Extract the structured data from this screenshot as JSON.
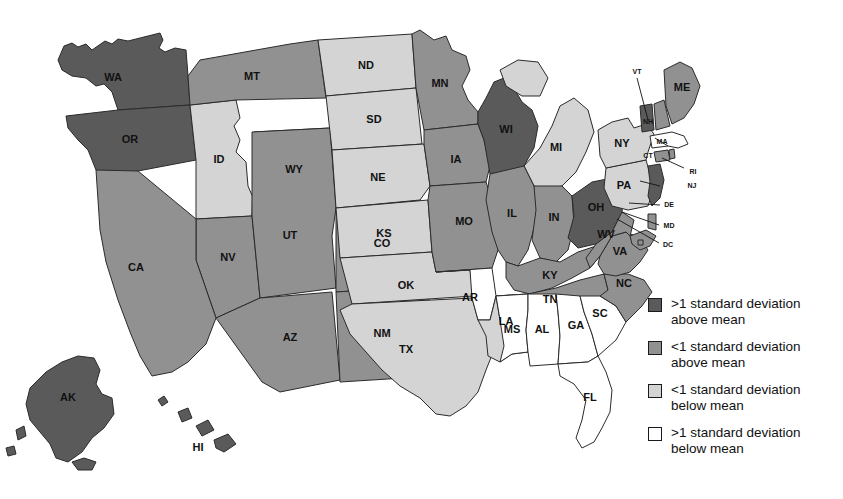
{
  "map": {
    "title": "US choropleth map of standard deviation from mean",
    "palette": {
      "dark": "#5a5a5a",
      "medium": "#919191",
      "light": "#d4d4d4",
      "white": "#ffffff",
      "border": "#2b2b2b"
    },
    "states": [
      {
        "code": "WA",
        "class": "dark"
      },
      {
        "code": "OR",
        "class": "dark"
      },
      {
        "code": "ID",
        "class": "light"
      },
      {
        "code": "MT",
        "class": "medium"
      },
      {
        "code": "WY",
        "class": "medium"
      },
      {
        "code": "NV",
        "class": "medium"
      },
      {
        "code": "CA",
        "class": "medium"
      },
      {
        "code": "UT",
        "class": "medium"
      },
      {
        "code": "CO",
        "class": "medium"
      },
      {
        "code": "AZ",
        "class": "medium"
      },
      {
        "code": "NM",
        "class": "medium"
      },
      {
        "code": "ND",
        "class": "light"
      },
      {
        "code": "SD",
        "class": "light"
      },
      {
        "code": "NE",
        "class": "light"
      },
      {
        "code": "KS",
        "class": "light"
      },
      {
        "code": "OK",
        "class": "light"
      },
      {
        "code": "TX",
        "class": "light"
      },
      {
        "code": "MN",
        "class": "medium"
      },
      {
        "code": "IA",
        "class": "medium"
      },
      {
        "code": "MO",
        "class": "medium"
      },
      {
        "code": "AR",
        "class": "white"
      },
      {
        "code": "LA",
        "class": "light"
      },
      {
        "code": "WI",
        "class": "dark"
      },
      {
        "code": "MI",
        "class": "light"
      },
      {
        "code": "IL",
        "class": "medium"
      },
      {
        "code": "IN",
        "class": "medium"
      },
      {
        "code": "OH",
        "class": "dark"
      },
      {
        "code": "KY",
        "class": "medium"
      },
      {
        "code": "TN",
        "class": "medium"
      },
      {
        "code": "MS",
        "class": "white"
      },
      {
        "code": "AL",
        "class": "white"
      },
      {
        "code": "GA",
        "class": "white"
      },
      {
        "code": "FL",
        "class": "white"
      },
      {
        "code": "SC",
        "class": "white"
      },
      {
        "code": "NC",
        "class": "medium"
      },
      {
        "code": "VA",
        "class": "medium"
      },
      {
        "code": "WV",
        "class": "medium"
      },
      {
        "code": "MD",
        "class": "medium"
      },
      {
        "code": "DE",
        "class": "medium"
      },
      {
        "code": "DC",
        "class": "medium"
      },
      {
        "code": "PA",
        "class": "light"
      },
      {
        "code": "NJ",
        "class": "dark"
      },
      {
        "code": "NY",
        "class": "light"
      },
      {
        "code": "CT",
        "class": "medium"
      },
      {
        "code": "RI",
        "class": "medium"
      },
      {
        "code": "MA",
        "class": "white"
      },
      {
        "code": "VT",
        "class": "dark"
      },
      {
        "code": "NH",
        "class": "medium"
      },
      {
        "code": "ME",
        "class": "medium"
      },
      {
        "code": "AK",
        "class": "dark"
      },
      {
        "code": "HI",
        "class": "dark"
      }
    ],
    "labels": {
      "WA": "WA",
      "OR": "OR",
      "ID": "ID",
      "MT": "MT",
      "WY": "WY",
      "NV": "NV",
      "CA": "CA",
      "UT": "UT",
      "CO": "CO",
      "AZ": "AZ",
      "NM": "NM",
      "ND": "ND",
      "SD": "SD",
      "NE": "NE",
      "KS": "KS",
      "OK": "OK",
      "TX": "TX",
      "MN": "MN",
      "IA": "IA",
      "MO": "MO",
      "AR": "AR",
      "LA": "LA",
      "WI": "WI",
      "MI": "MI",
      "IL": "IL",
      "IN": "IN",
      "OH": "OH",
      "KY": "KY",
      "TN": "TN",
      "MS": "MS",
      "AL": "AL",
      "GA": "GA",
      "FL": "FL",
      "SC": "SC",
      "NC": "NC",
      "VA": "VA",
      "WV": "WV",
      "MD": "MD",
      "DE": "DE",
      "DC": "DC",
      "PA": "PA",
      "NJ": "NJ",
      "NY": "NY",
      "CT": "CT",
      "RI": "RI",
      "MA": "MA",
      "VT": "VT",
      "NH": "NH",
      "ME": "ME",
      "AK": "AK",
      "HI": "HI"
    }
  },
  "legend": {
    "items": [
      {
        "swatch": "#5a5a5a",
        "line1": ">1 standard deviation",
        "line2": "above mean"
      },
      {
        "swatch": "#919191",
        "line1": "<1 standard deviation",
        "line2": "above mean"
      },
      {
        "swatch": "#d4d4d4",
        "line1": "<1 standard deviation",
        "line2": "below mean"
      },
      {
        "swatch": "#ffffff",
        "line1": ">1 standard deviation",
        "line2": "below mean"
      }
    ]
  },
  "chart_data": {
    "type": "heatmap",
    "categories": [
      "WA",
      "OR",
      "ID",
      "MT",
      "WY",
      "NV",
      "CA",
      "UT",
      "CO",
      "AZ",
      "NM",
      "ND",
      "SD",
      "NE",
      "KS",
      "OK",
      "TX",
      "MN",
      "IA",
      "MO",
      "AR",
      "LA",
      "WI",
      "MI",
      "IL",
      "IN",
      "OH",
      "KY",
      "TN",
      "MS",
      "AL",
      "GA",
      "FL",
      "SC",
      "NC",
      "VA",
      "WV",
      "MD",
      "DE",
      "DC",
      "PA",
      "NJ",
      "NY",
      "CT",
      "RI",
      "MA",
      "VT",
      "NH",
      "ME",
      "AK",
      "HI"
    ],
    "values": [
      "dark",
      "dark",
      "light",
      "medium",
      "medium",
      "medium",
      "medium",
      "medium",
      "medium",
      "medium",
      "medium",
      "light",
      "light",
      "light",
      "light",
      "light",
      "light",
      "medium",
      "medium",
      "medium",
      "white",
      "light",
      "dark",
      "light",
      "medium",
      "medium",
      "dark",
      "medium",
      "medium",
      "white",
      "white",
      "white",
      "white",
      "white",
      "medium",
      "medium",
      "medium",
      "medium",
      "medium",
      "medium",
      "light",
      "dark",
      "light",
      "medium",
      "medium",
      "white",
      "dark",
      "medium",
      "medium",
      "dark",
      "dark"
    ],
    "legend_position": "right",
    "bins": [
      ">1 standard deviation above mean",
      "<1 standard deviation above mean",
      "<1 standard deviation below mean",
      ">1 standard deviation below mean"
    ]
  }
}
